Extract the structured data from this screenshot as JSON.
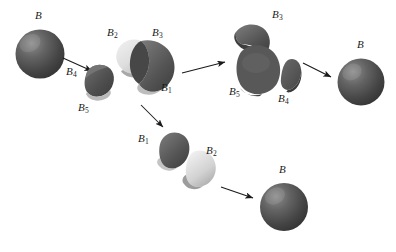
{
  "figure": {
    "type": "banach-tarski-decomposition",
    "background_color": "#ffffff",
    "ink_color": "#1a1a1a",
    "piece_dark_color": "#555555",
    "piece_light_color": "#d8d8d8",
    "sphere_color": "#4a4a4a"
  },
  "labels": {
    "source_sphere": {
      "base": "B",
      "sub": ""
    },
    "piece1_mid": {
      "base": "B",
      "sub": "1"
    },
    "piece2_mid": {
      "base": "B",
      "sub": "2"
    },
    "piece3_mid": {
      "base": "B",
      "sub": "3"
    },
    "piece4_arrow": {
      "base": "B",
      "sub": "4"
    },
    "piece5_left": {
      "base": "B",
      "sub": "5"
    },
    "piece3_right": {
      "base": "B",
      "sub": "3"
    },
    "piece5_right": {
      "base": "B",
      "sub": "5"
    },
    "piece4_right": {
      "base": "B",
      "sub": "4"
    },
    "result_sphere_top": {
      "base": "B",
      "sub": ""
    },
    "piece1_bottom": {
      "base": "B",
      "sub": "1"
    },
    "piece2_bottom": {
      "base": "B",
      "sub": "2"
    },
    "result_sphere_bottom": {
      "base": "B",
      "sub": ""
    }
  },
  "arrows": [
    {
      "name": "arrow-source-to-split",
      "from": [
        63,
        58
      ],
      "to": [
        95,
        72
      ]
    },
    {
      "name": "arrow-split-to-top-cluster",
      "from": [
        182,
        73
      ],
      "to": [
        228,
        62
      ]
    },
    {
      "name": "arrow-split-to-bottom-row",
      "from": [
        141,
        105
      ],
      "to": [
        166,
        130
      ]
    },
    {
      "name": "arrow-top-cluster-to-sphere",
      "from": [
        303,
        63
      ],
      "to": [
        334,
        78
      ]
    },
    {
      "name": "arrow-bottom-row-to-sphere",
      "from": [
        221,
        187
      ],
      "to": [
        256,
        199
      ]
    }
  ]
}
